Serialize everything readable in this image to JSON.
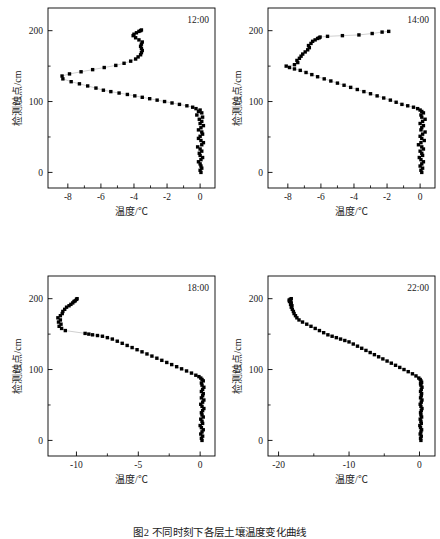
{
  "figure": {
    "caption": "图2  不同时刻下各层土壤温度变化曲线",
    "y_axis_label": "检测触点/cm",
    "x_axis_label": "温度/℃",
    "marker_color": "#000000",
    "line_color": "#000000"
  },
  "chart_data": [
    {
      "type": "scatter",
      "title": "12:00",
      "xlabel": "温度/℃",
      "ylabel": "检测触点/cm",
      "xlim": [
        -9.2,
        0.9
      ],
      "ylim": [
        -22,
        232
      ],
      "xticks": [
        -8,
        -6,
        -4,
        -2,
        0
      ],
      "xticklabels": [
        "-8",
        "-6",
        "-4",
        "-2",
        "0"
      ],
      "yticks": [
        0,
        100,
        200
      ],
      "yticklabels": [
        "0",
        "100",
        "200"
      ],
      "yminorticks": [
        50,
        150
      ],
      "grid": false,
      "legend": false,
      "x": [
        0.05,
        0.0,
        0.1,
        0.05,
        0.0,
        -0.1,
        0.05,
        0.15,
        0.0,
        -0.05,
        0.1,
        0.0,
        -0.15,
        0.1,
        0.2,
        0.05,
        -0.1,
        0.0,
        0.15,
        0.1,
        -0.1,
        0.05,
        0.2,
        0.0,
        0.1,
        -0.05,
        0.15,
        -0.2,
        0.1,
        -0.1,
        0.0,
        -0.25,
        -0.45,
        -0.8,
        -1.25,
        -1.7,
        -2.15,
        -2.6,
        -3.05,
        -3.5,
        -3.95,
        -4.4,
        -4.9,
        -5.4,
        -5.85,
        -6.3,
        -6.8,
        -7.3,
        -7.8,
        -8.3,
        -8.35,
        -7.9,
        -7.2,
        -6.5,
        -5.8,
        -5.1,
        -4.6,
        -4.2,
        -3.9,
        -3.75,
        -3.6,
        -3.55,
        -3.5,
        -3.55,
        -3.6,
        -3.55,
        -3.5,
        -3.7,
        -3.9,
        -4.05,
        -4.0,
        -3.85,
        -3.7,
        -3.6,
        -3.55
      ],
      "y": [
        0,
        3,
        6,
        9,
        12,
        15,
        18,
        21,
        24,
        27,
        30,
        33,
        36,
        39,
        42,
        45,
        48,
        51,
        54,
        57,
        60,
        63,
        66,
        69,
        72,
        75,
        78,
        81,
        84,
        86,
        88,
        90,
        92,
        94,
        96,
        98,
        100,
        102,
        104,
        106,
        108,
        110,
        112,
        114,
        116,
        119,
        122,
        125,
        128,
        132,
        136,
        139,
        142,
        145,
        148,
        151,
        154,
        157,
        160,
        163,
        166,
        169,
        172,
        175,
        178,
        181,
        184,
        187,
        190,
        193,
        195,
        197,
        199,
        200,
        201
      ]
    },
    {
      "type": "scatter",
      "title": "14:00",
      "xlabel": "温度/℃",
      "ylabel": "检测触点/cm",
      "xlim": [
        -9.2,
        0.9
      ],
      "ylim": [
        -22,
        232
      ],
      "xticks": [
        -8,
        -6,
        -4,
        -2,
        0
      ],
      "xticklabels": [
        "-8",
        "-6",
        "-4",
        "-2",
        "0"
      ],
      "yticks": [
        0,
        100,
        200
      ],
      "yticklabels": [
        "0",
        "100",
        "200"
      ],
      "yminorticks": [
        50,
        150
      ],
      "grid": false,
      "legend": false,
      "x": [
        0.1,
        0.05,
        0.15,
        0.0,
        0.1,
        0.2,
        0.05,
        -0.05,
        0.15,
        0.1,
        0.0,
        0.2,
        0.1,
        -0.1,
        0.05,
        0.25,
        0.1,
        0.0,
        0.15,
        0.3,
        0.05,
        0.1,
        0.2,
        0.0,
        0.15,
        0.3,
        0.1,
        0.05,
        0.2,
        0.1,
        0.0,
        -0.15,
        -0.4,
        -0.75,
        -1.1,
        -1.45,
        -1.8,
        -2.2,
        -2.6,
        -3.0,
        -3.4,
        -3.8,
        -4.2,
        -4.6,
        -5.0,
        -5.4,
        -5.8,
        -6.2,
        -6.55,
        -6.9,
        -7.25,
        -7.6,
        -7.9,
        -8.1,
        -7.6,
        -7.4,
        -7.45,
        -7.3,
        -7.2,
        -7.1,
        -6.95,
        -6.8,
        -6.7,
        -6.75,
        -6.6,
        -6.5,
        -6.35,
        -6.2,
        -6.1,
        -6.05,
        -5.6,
        -4.7,
        -3.7,
        -2.9,
        -2.3,
        -1.9
      ],
      "y": [
        0,
        3,
        6,
        9,
        12,
        15,
        18,
        21,
        24,
        27,
        30,
        33,
        36,
        39,
        42,
        45,
        48,
        51,
        54,
        57,
        60,
        63,
        66,
        69,
        72,
        75,
        78,
        81,
        84,
        86,
        88,
        90,
        92,
        94,
        96,
        99,
        102,
        105,
        108,
        111,
        114,
        117,
        120,
        123,
        126,
        129,
        132,
        135,
        138,
        141,
        144,
        146,
        148,
        150,
        152,
        155,
        158,
        161,
        164,
        167,
        170,
        173,
        176,
        179,
        182,
        185,
        187,
        189,
        190,
        191,
        192,
        193,
        194,
        196,
        198,
        199
      ]
    },
    {
      "type": "scatter",
      "title": "18:00",
      "xlabel": "温度/℃",
      "ylabel": "检测触点/cm",
      "xlim": [
        -12.3,
        1.2
      ],
      "ylim": [
        -22,
        232
      ],
      "xticks": [
        -10,
        -5,
        0
      ],
      "xticklabels": [
        "-10",
        "-5",
        "0"
      ],
      "yticks": [
        0,
        100,
        200
      ],
      "yticklabels": [
        "0",
        "100",
        "200"
      ],
      "yminorticks": [
        50,
        150
      ],
      "grid": false,
      "legend": false,
      "x": [
        0.15,
        0.1,
        0.2,
        0.05,
        0.15,
        0.25,
        0.1,
        0.0,
        0.2,
        0.15,
        0.05,
        0.25,
        0.15,
        0.1,
        0.2,
        0.3,
        0.15,
        0.05,
        0.2,
        0.3,
        0.1,
        0.2,
        0.25,
        0.1,
        0.2,
        0.3,
        0.15,
        0.1,
        0.25,
        0.15,
        0.05,
        -0.1,
        -0.35,
        -0.7,
        -1.1,
        -1.5,
        -1.9,
        -2.3,
        -2.7,
        -3.1,
        -3.5,
        -3.9,
        -4.3,
        -4.7,
        -5.1,
        -5.5,
        -5.9,
        -6.3,
        -6.7,
        -7.1,
        -7.5,
        -7.9,
        -8.3,
        -8.7,
        -9.0,
        -9.3,
        -10.9,
        -11.2,
        -11.4,
        -11.25,
        -11.45,
        -11.3,
        -11.5,
        -11.3,
        -11.15,
        -11.1,
        -10.95,
        -10.8,
        -10.6,
        -10.45,
        -10.3,
        -10.2,
        -10.1,
        -10.0,
        -9.95
      ],
      "y": [
        0,
        3,
        6,
        9,
        12,
        15,
        18,
        21,
        24,
        27,
        30,
        33,
        36,
        39,
        42,
        45,
        48,
        51,
        54,
        57,
        60,
        63,
        66,
        69,
        72,
        75,
        78,
        81,
        84,
        86,
        88,
        90,
        92,
        95,
        98,
        101,
        104,
        107,
        110,
        113,
        116,
        119,
        122,
        125,
        128,
        131,
        134,
        137,
        140,
        143,
        145,
        147,
        148,
        149,
        150,
        151,
        155,
        158,
        161,
        164,
        167,
        170,
        173,
        176,
        179,
        182,
        185,
        188,
        190,
        192,
        194,
        196,
        197,
        199,
        200
      ]
    },
    {
      "type": "scatter",
      "title": "22:00",
      "xlabel": "温度/℃",
      "ylabel": "检测触点/cm",
      "xlim": [
        -21.5,
        2.2
      ],
      "ylim": [
        -22,
        232
      ],
      "xticks": [
        -20,
        -10,
        0
      ],
      "xticklabels": [
        "-20",
        "-10",
        "0"
      ],
      "yticks": [
        0,
        100,
        200
      ],
      "yticklabels": [
        "0",
        "100",
        "200"
      ],
      "yminorticks": [
        50,
        150
      ],
      "grid": false,
      "legend": false,
      "x": [
        0.2,
        0.15,
        0.25,
        0.1,
        0.2,
        0.3,
        0.15,
        0.05,
        0.25,
        0.2,
        0.1,
        0.3,
        0.2,
        0.15,
        0.25,
        0.35,
        0.2,
        0.1,
        0.25,
        0.35,
        0.15,
        0.25,
        0.3,
        0.15,
        0.25,
        0.35,
        0.2,
        0.15,
        0.3,
        0.2,
        0.1,
        -0.1,
        -0.5,
        -1.0,
        -1.6,
        -2.2,
        -2.8,
        -3.4,
        -4.0,
        -4.6,
        -5.2,
        -5.8,
        -6.4,
        -7.0,
        -7.6,
        -8.2,
        -8.8,
        -9.4,
        -10.0,
        -10.6,
        -11.2,
        -11.8,
        -12.4,
        -13.0,
        -13.6,
        -14.2,
        -14.8,
        -15.4,
        -16.0,
        -16.6,
        -17.1,
        -17.4,
        -17.6,
        -17.8,
        -17.9,
        -18.05,
        -18.2,
        -18.1,
        -18.3,
        -18.2,
        -18.45,
        -18.3,
        -18.5,
        -18.35,
        -18.2
      ],
      "y": [
        0,
        3,
        6,
        9,
        12,
        15,
        18,
        21,
        24,
        27,
        30,
        33,
        36,
        39,
        42,
        45,
        48,
        51,
        54,
        57,
        60,
        63,
        66,
        69,
        72,
        75,
        78,
        80,
        82,
        84,
        86,
        88,
        91,
        94,
        97,
        100,
        103,
        106,
        109,
        112,
        115,
        118,
        121,
        124,
        127,
        130,
        133,
        136,
        139,
        141,
        143,
        145,
        147,
        149,
        152,
        155,
        158,
        161,
        164,
        167,
        170,
        173,
        176,
        179,
        182,
        185,
        188,
        190,
        192,
        194,
        196,
        197,
        198,
        199,
        200
      ]
    }
  ]
}
